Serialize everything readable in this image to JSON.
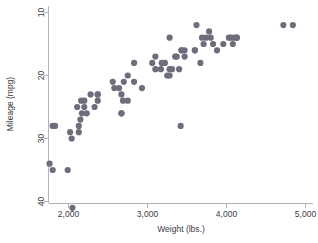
{
  "chart_data": {
    "type": "scatter",
    "title": "",
    "xlabel": "Weight (lbs.)",
    "ylabel": "Mileage (mpg)",
    "xlim": [
      1600,
      5100
    ],
    "ylim": [
      8,
      42
    ],
    "y_inverted": true,
    "grid": false,
    "legend": null,
    "xticks": [
      2000,
      3000,
      4000,
      5000
    ],
    "xtick_labels": [
      "2,000",
      "3,000",
      "4,000",
      "5,000"
    ],
    "yticks": [
      10,
      20,
      30,
      40
    ],
    "ytick_labels": [
      "10",
      "20",
      "30",
      "40"
    ],
    "marker_color": "#6d6d7c",
    "marker_size": 3.1,
    "axis_color": "#b3b3bf",
    "text_color": "#3b3b46",
    "background": "#ffffff",
    "series": [
      {
        "name": "Mileage vs Weight",
        "x": [
          2930,
          3350,
          2640,
          3250,
          4080,
          3670,
          2230,
          3280,
          3880,
          3400,
          3310,
          3060,
          3600,
          2700,
          3690,
          3180,
          3220,
          4130,
          4130,
          4100,
          3620,
          3600,
          3740,
          3960,
          3830,
          4060,
          3280,
          2690,
          4030,
          3370,
          2830,
          2580,
          4720,
          3430,
          3280,
          2750,
          3430,
          3780,
          3100,
          3470,
          3710,
          3100,
          3470,
          3800,
          4840,
          2110,
          2200,
          1800,
          2670,
          2750,
          2170,
          2370,
          2020,
          2280,
          1800,
          1830,
          2160,
          2040,
          2560,
          1760,
          2050,
          2130,
          1990,
          2150,
          2670,
          2370,
          2330,
          2200,
          2670,
          2370,
          2130,
          3170,
          2830,
          3420
        ],
        "y": [
          22,
          17,
          22,
          20,
          15,
          18,
          26,
          20,
          16,
          19,
          19,
          18,
          16,
          21,
          14,
          18,
          18,
          14,
          14,
          14,
          12,
          16,
          14,
          15,
          15,
          14,
          19,
          24,
          14,
          17,
          21,
          22,
          12,
          16,
          14,
          24,
          16,
          13,
          19,
          16,
          15,
          17,
          17,
          14,
          12,
          25,
          24,
          28,
          23,
          20,
          26,
          24,
          29,
          23,
          35,
          28,
          24,
          30,
          21,
          34,
          41,
          29,
          35,
          27,
          26,
          23,
          25,
          25,
          26,
          23,
          28,
          19,
          18,
          28
        ]
      }
    ]
  },
  "axis": {
    "x_title": "Weight (lbs.)",
    "y_title": "Mileage (mpg)",
    "x_labels": [
      "2,000",
      "3,000",
      "4,000",
      "5,000"
    ],
    "y_labels": [
      "10",
      "20",
      "30",
      "40"
    ]
  }
}
